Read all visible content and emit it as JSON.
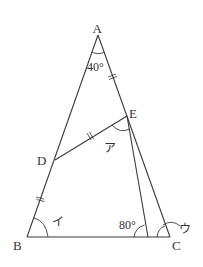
{
  "diagram": {
    "type": "geometry",
    "points": {
      "A": {
        "label": "A",
        "x": 98,
        "y": 35
      },
      "B": {
        "label": "B",
        "x": 27,
        "y": 237
      },
      "C": {
        "label": "C",
        "x": 170,
        "y": 237
      },
      "D": {
        "label": "D",
        "x": 55,
        "y": 160
      },
      "E": {
        "label": "E",
        "x": 127,
        "y": 116
      },
      "F": {
        "label": "",
        "x": 148,
        "y": 237
      }
    },
    "angles": {
      "A": "40°",
      "EFB": "80°",
      "a": "ア",
      "i": "イ",
      "u": "ウ"
    },
    "segments": [
      "AB",
      "AC",
      "BC",
      "DE",
      "EF"
    ],
    "equal_marks": [
      "AE",
      "DE",
      "DB"
    ],
    "colors": {
      "line": "#3a3a3a",
      "text": "#333333",
      "background": "#ffffff"
    }
  }
}
